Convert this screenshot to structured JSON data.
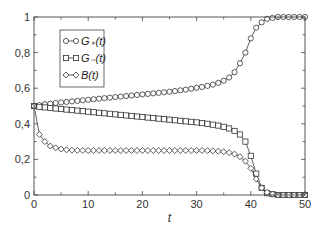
{
  "chart_data": {
    "type": "line",
    "title": "",
    "xlabel": "t",
    "ylabel": "",
    "xlim": [
      0,
      50
    ],
    "ylim": [
      0,
      1
    ],
    "x_ticks": [
      0,
      10,
      20,
      30,
      40,
      50
    ],
    "x_tick_labels": [
      "0",
      "10",
      "20",
      "30",
      "40",
      "50"
    ],
    "y_ticks": [
      0,
      0.2,
      0.4,
      0.6,
      0.8,
      1
    ],
    "y_tick_labels": [
      "0",
      "0,2",
      "0,4",
      "0,6",
      "0,8",
      "1"
    ],
    "grid": false,
    "legend_position": "upper left",
    "x": [
      0,
      1,
      2,
      3,
      4,
      5,
      6,
      7,
      8,
      9,
      10,
      11,
      12,
      13,
      14,
      15,
      16,
      17,
      18,
      19,
      20,
      21,
      22,
      23,
      24,
      25,
      26,
      27,
      28,
      29,
      30,
      31,
      32,
      33,
      34,
      35,
      36,
      37,
      38,
      39,
      40,
      41,
      42,
      43,
      44,
      45,
      46,
      47,
      48,
      49,
      50
    ],
    "series": [
      {
        "name": "G+(t)",
        "legend_label": "G₊(t)",
        "marker": "circle",
        "values": [
          0.5,
          0.505,
          0.51,
          0.513,
          0.517,
          0.52,
          0.523,
          0.526,
          0.529,
          0.532,
          0.535,
          0.538,
          0.541,
          0.544,
          0.547,
          0.55,
          0.553,
          0.556,
          0.559,
          0.562,
          0.565,
          0.568,
          0.571,
          0.574,
          0.577,
          0.58,
          0.584,
          0.588,
          0.592,
          0.597,
          0.602,
          0.607,
          0.613,
          0.62,
          0.63,
          0.642,
          0.66,
          0.69,
          0.74,
          0.8,
          0.88,
          0.94,
          0.97,
          0.99,
          0.995,
          1.0,
          1.0,
          1.0,
          1.0,
          1.0,
          1.0
        ]
      },
      {
        "name": "G-(t)",
        "legend_label": "G₋(t)",
        "marker": "square",
        "values": [
          0.5,
          0.495,
          0.492,
          0.489,
          0.486,
          0.483,
          0.48,
          0.477,
          0.474,
          0.471,
          0.468,
          0.465,
          0.462,
          0.459,
          0.456,
          0.453,
          0.45,
          0.447,
          0.444,
          0.441,
          0.438,
          0.435,
          0.432,
          0.429,
          0.426,
          0.423,
          0.42,
          0.417,
          0.414,
          0.411,
          0.408,
          0.404,
          0.4,
          0.395,
          0.39,
          0.383,
          0.374,
          0.36,
          0.34,
          0.3,
          0.22,
          0.12,
          0.04,
          0.01,
          0.005,
          0.0,
          0.0,
          0.0,
          0.0,
          0.0,
          0.0
        ]
      },
      {
        "name": "B(t)",
        "legend_label": "B(t)",
        "marker": "diamond",
        "values": [
          0.5,
          0.34,
          0.3,
          0.275,
          0.265,
          0.258,
          0.254,
          0.252,
          0.251,
          0.25,
          0.25,
          0.25,
          0.25,
          0.25,
          0.25,
          0.25,
          0.25,
          0.25,
          0.25,
          0.25,
          0.25,
          0.25,
          0.25,
          0.25,
          0.25,
          0.25,
          0.25,
          0.25,
          0.25,
          0.25,
          0.25,
          0.25,
          0.249,
          0.248,
          0.246,
          0.243,
          0.238,
          0.23,
          0.215,
          0.19,
          0.15,
          0.09,
          0.04,
          0.015,
          0.005,
          0.0,
          0.0,
          0.0,
          0.0,
          0.0,
          0.0
        ]
      }
    ]
  },
  "colors": {
    "line": "#333333",
    "axis": "#444444",
    "background": "#ffffff"
  },
  "layout": {
    "plot_left": 34,
    "plot_right": 305,
    "plot_top": 17,
    "plot_bottom": 195
  }
}
